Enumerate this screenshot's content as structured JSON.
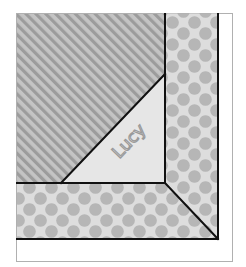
{
  "figure": {
    "label": "Lucy",
    "colors": {
      "background": "#ffffff",
      "frame_border": "#b0b0b0",
      "stripe_light": "#c4c4c4",
      "stripe_dark": "#9c9c9c",
      "dot_background": "#dddddd",
      "dot": "#b6b6b6",
      "triangle_fill": "#e6e6e6",
      "label_color": "#9a9a9a",
      "seam_line": "#111111"
    },
    "regions": [
      {
        "name": "striped-area",
        "pattern": "diagonal-stripes"
      },
      {
        "name": "lucy-triangle",
        "pattern": "solid-light"
      },
      {
        "name": "dotted-border-right",
        "pattern": "polka-dots"
      },
      {
        "name": "dotted-border-bottom",
        "pattern": "polka-dots"
      },
      {
        "name": "white-outer-margin",
        "pattern": "solid-white"
      }
    ]
  }
}
